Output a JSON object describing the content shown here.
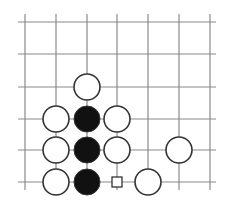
{
  "diagram": {
    "type": "go-board-fragment",
    "grid": {
      "columns_x": [
        25,
        56,
        87,
        117,
        148,
        179,
        210
      ],
      "rows_y": [
        22,
        54,
        87,
        119,
        150,
        182
      ],
      "line_x_start": 18,
      "line_x_end": 216,
      "line_y_start": 14,
      "line_y_end": 190,
      "line_color": "#8a8a8a"
    },
    "stone_radius": 13,
    "stones": [
      {
        "color": "white",
        "col": 2,
        "row": 2
      },
      {
        "color": "white",
        "col": 1,
        "row": 3
      },
      {
        "color": "black",
        "col": 2,
        "row": 3
      },
      {
        "color": "white",
        "col": 3,
        "row": 3
      },
      {
        "color": "white",
        "col": 1,
        "row": 4
      },
      {
        "color": "black",
        "col": 2,
        "row": 4
      },
      {
        "color": "white",
        "col": 3,
        "row": 4
      },
      {
        "color": "white",
        "col": 5,
        "row": 4
      },
      {
        "color": "white",
        "col": 1,
        "row": 5
      },
      {
        "color": "black",
        "col": 2,
        "row": 5
      },
      {
        "color": "white",
        "col": 4,
        "row": 5
      }
    ],
    "markers": [
      {
        "shape": "square",
        "col": 3,
        "row": 5,
        "size": 10
      }
    ],
    "colors": {
      "black_stone": "#111111",
      "white_stone_fill": "#ffffff",
      "stone_outline": "#333333"
    }
  }
}
